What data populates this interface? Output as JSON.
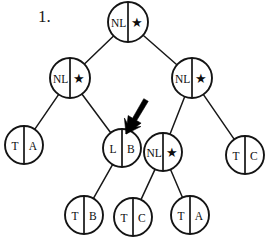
{
  "figure": {
    "item_number": "1.",
    "diagram_type": "binary-tree",
    "ink_color": "#141414",
    "background_color": "#ffffff",
    "node_fill": "#ffffff",
    "star_glyph": "★",
    "nodes": [
      {
        "id": "root",
        "left": "NL",
        "right": "*",
        "cx": 128,
        "cy": 22,
        "r": 20,
        "label_role": "root"
      },
      {
        "id": "n-l",
        "left": "NL",
        "right": "*",
        "cx": 70,
        "cy": 78,
        "r": 20,
        "label_role": "internal"
      },
      {
        "id": "n-r",
        "left": "NL",
        "right": "*",
        "cx": 192,
        "cy": 78,
        "r": 20,
        "label_role": "internal"
      },
      {
        "id": "n-ll",
        "left": "T",
        "right": "A",
        "cx": 24,
        "cy": 145,
        "r": 19,
        "label_role": "leaf"
      },
      {
        "id": "n-lr",
        "left": "L",
        "right": "B",
        "cx": 122,
        "cy": 148,
        "r": 19,
        "label_role": "internal"
      },
      {
        "id": "n-rl",
        "left": "NL",
        "right": "*",
        "cx": 163,
        "cy": 152,
        "r": 19,
        "label_role": "internal"
      },
      {
        "id": "n-rr",
        "left": "T",
        "right": "C",
        "cx": 245,
        "cy": 155,
        "r": 19,
        "label_role": "leaf"
      },
      {
        "id": "n-lrl",
        "left": "T",
        "right": "B",
        "cx": 84,
        "cy": 215,
        "r": 19,
        "label_role": "leaf"
      },
      {
        "id": "n-rll",
        "left": "T",
        "right": "C",
        "cx": 133,
        "cy": 217,
        "r": 19,
        "label_role": "leaf"
      },
      {
        "id": "n-rlr",
        "left": "T",
        "right": "A",
        "cx": 190,
        "cy": 215,
        "r": 19,
        "label_role": "leaf"
      }
    ],
    "edges": [
      {
        "from": "root",
        "to": "n-l"
      },
      {
        "from": "root",
        "to": "n-r"
      },
      {
        "from": "n-l",
        "to": "n-ll"
      },
      {
        "from": "n-l",
        "to": "n-lr"
      },
      {
        "from": "n-r",
        "to": "n-rl"
      },
      {
        "from": "n-r",
        "to": "n-rr"
      },
      {
        "from": "n-lr",
        "to": "n-lrl"
      },
      {
        "from": "n-rl",
        "to": "n-rll"
      },
      {
        "from": "n-rl",
        "to": "n-rlr"
      }
    ],
    "annotation": {
      "name": "pointer-arrow",
      "points_to": "n-lr",
      "direction": "down-left",
      "tip_x": 126,
      "tip_y": 134,
      "tail_x": 146,
      "tail_y": 100
    }
  }
}
